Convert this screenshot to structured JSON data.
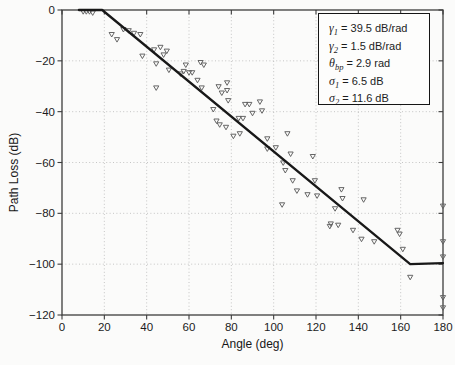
{
  "figure": {
    "x_label": "Angle (deg)",
    "y_label": "Path Loss (dB)"
  },
  "legend": {
    "items": [
      {
        "sym": "γ",
        "sub": "1",
        "rest": " = 39.5 dB/rad"
      },
      {
        "sym": "γ",
        "sub": "2",
        "rest": " = 1.5 dB/rad"
      },
      {
        "sym": "θ",
        "sub": "bp",
        "rest": " = 2.9 rad"
      },
      {
        "sym": "σ",
        "sub": "1",
        "rest": " = 6.5 dB"
      },
      {
        "sym": "σ",
        "sub": "2",
        "rest": " = 11.6 dB"
      }
    ]
  },
  "chart_data": {
    "type": "scatter",
    "title": "",
    "xlabel": "Angle (deg)",
    "ylabel": "Path Loss (dB)",
    "xlim": [
      0,
      180
    ],
    "ylim": [
      -120,
      0
    ],
    "x_ticks": [
      0,
      20,
      40,
      60,
      80,
      100,
      120,
      140,
      160,
      180
    ],
    "x_tick_labels": [
      "0",
      "20",
      "40",
      "60",
      "80",
      "100",
      "120",
      "140",
      "160",
      "180"
    ],
    "y_ticks": [
      0,
      -20,
      -40,
      -60,
      -80,
      -100,
      -120
    ],
    "y_tick_labels": [
      "0",
      "−20",
      "−40",
      "−60",
      "−80",
      "−100",
      "−120"
    ],
    "grid": true,
    "legend_position": "top-right",
    "legend_text": [
      "γ1 = 39.5 dB/rad",
      "γ2 = 1.5 dB/rad",
      "θbp = 2.9 rad",
      "σ1 = 6.5 dB",
      "σ2 = 11.6 dB"
    ],
    "series": [
      {
        "name": "measured path loss samples",
        "type": "scatter",
        "marker": "triangle-down-open",
        "color": "#5e5e5e",
        "points": [
          [
            10,
            -0.5
          ],
          [
            11.5,
            -0.5
          ],
          [
            13,
            -0.5
          ],
          [
            14.5,
            -1
          ],
          [
            23.5,
            -9.5
          ],
          [
            26,
            -11.5
          ],
          [
            29,
            -7.5
          ],
          [
            31.5,
            -8
          ],
          [
            34,
            -9
          ],
          [
            37,
            -9.5
          ],
          [
            38,
            -18
          ],
          [
            43.5,
            -15.5
          ],
          [
            44.5,
            -21
          ],
          [
            44.5,
            -30.5
          ],
          [
            46.5,
            -14.5
          ],
          [
            48,
            -17.5
          ],
          [
            49.5,
            -16
          ],
          [
            50.5,
            -23.5
          ],
          [
            56,
            -25
          ],
          [
            57.5,
            -24
          ],
          [
            58.5,
            -21.5
          ],
          [
            60,
            -24.5
          ],
          [
            61.5,
            -24.5
          ],
          [
            64,
            -27.5
          ],
          [
            65.5,
            -20.5
          ],
          [
            67,
            -21.5
          ],
          [
            66,
            -30.5
          ],
          [
            71.5,
            -39
          ],
          [
            73,
            -43.5
          ],
          [
            74,
            -30
          ],
          [
            74.5,
            -45
          ],
          [
            75.5,
            -32.5
          ],
          [
            77.5,
            -46
          ],
          [
            78,
            -28.5
          ],
          [
            78,
            -31.5
          ],
          [
            78.5,
            -35.5
          ],
          [
            81,
            -49.5
          ],
          [
            83.5,
            -42.5
          ],
          [
            85.5,
            -42.5
          ],
          [
            84,
            -48.5
          ],
          [
            86.5,
            -37
          ],
          [
            88.5,
            -37
          ],
          [
            90,
            -40.5
          ],
          [
            93.5,
            -36
          ],
          [
            94.5,
            -39.5
          ],
          [
            97,
            -50.5
          ],
          [
            97,
            -54.5
          ],
          [
            101,
            -54
          ],
          [
            104,
            -76.5
          ],
          [
            104.5,
            -60
          ],
          [
            105.5,
            -63
          ],
          [
            106.5,
            -48.5
          ],
          [
            108,
            -56.5
          ],
          [
            109,
            -67
          ],
          [
            111,
            -71
          ],
          [
            116,
            -72.5
          ],
          [
            118.5,
            -57.5
          ],
          [
            119.5,
            -67
          ],
          [
            120.5,
            -73
          ],
          [
            126.5,
            -85
          ],
          [
            127,
            -84
          ],
          [
            129,
            -78
          ],
          [
            130.5,
            -84.5
          ],
          [
            132,
            -70.5
          ],
          [
            132.5,
            -74
          ],
          [
            137.5,
            -86.5
          ],
          [
            141.5,
            -90
          ],
          [
            142.5,
            -74.5
          ],
          [
            147.5,
            -91
          ],
          [
            158.5,
            -86.5
          ],
          [
            159.5,
            -88
          ],
          [
            161,
            -94
          ],
          [
            164.5,
            -105
          ],
          [
            180,
            -77
          ],
          [
            180,
            -91
          ],
          [
            180,
            -97
          ],
          [
            180,
            -113
          ],
          [
            180,
            -117
          ]
        ]
      },
      {
        "name": "dual-slope regression fit",
        "type": "line",
        "color": "#181818",
        "points": [
          [
            8,
            0
          ],
          [
            19,
            0
          ],
          [
            164.5,
            -100
          ],
          [
            180,
            -99.6
          ]
        ]
      }
    ]
  }
}
